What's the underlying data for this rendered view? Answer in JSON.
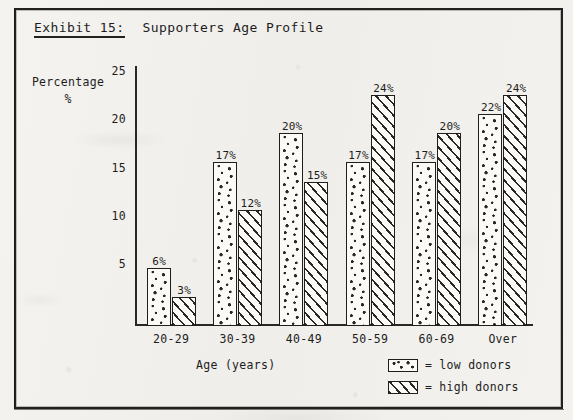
{
  "document": {
    "exhibit_label": "Exhibit 15:",
    "title": "Supporters Age Profile"
  },
  "axes": {
    "y_label_line1": "Percentage",
    "y_label_line2": "%",
    "x_title": "Age (years)",
    "y_ticks": [
      "5",
      "10",
      "15",
      "20",
      "25"
    ]
  },
  "legend": {
    "position": "bottom-right",
    "equals": "=",
    "items": [
      {
        "swatch": "dotted-fill",
        "label": "low donors"
      },
      {
        "swatch": "diagonal-hatch-fill",
        "label": "high donors"
      }
    ]
  },
  "chart_data": {
    "type": "bar",
    "title": "Exhibit 15: Supporters Age Profile",
    "subtitle": "",
    "xlabel": "Age (years)",
    "ylabel": "Percentage %",
    "ylim": [
      0,
      27
    ],
    "ytick_values": [
      5,
      10,
      15,
      20,
      25
    ],
    "grid": false,
    "legend_position": "bottom-right",
    "categories": [
      "20-29",
      "30-39",
      "40-49",
      "50-59",
      "60-69",
      "Over"
    ],
    "series": [
      {
        "name": "low donors",
        "fill": "dotted",
        "values": [
          6,
          17,
          20,
          17,
          17,
          22
        ],
        "data_labels": [
          "6%",
          "17%",
          "20%",
          "17%",
          "17%",
          "22%"
        ]
      },
      {
        "name": "high donors",
        "fill": "diagonal-hatch",
        "values": [
          3,
          12,
          15,
          24,
          20,
          24
        ],
        "data_labels": [
          "3%",
          "12%",
          "15%",
          "24%",
          "20%",
          "24%"
        ]
      }
    ]
  }
}
